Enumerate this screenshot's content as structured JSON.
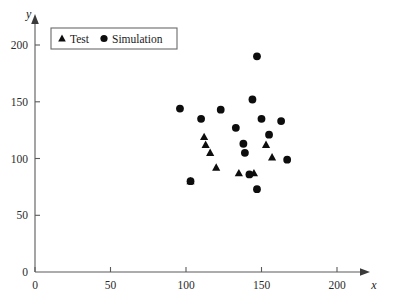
{
  "chart_data": {
    "type": "scatter",
    "title": "",
    "xlabel": "x",
    "ylabel": "y",
    "xlim": [
      0,
      215
    ],
    "ylim": [
      0,
      215
    ],
    "xticks": [
      0,
      50,
      100,
      150,
      200
    ],
    "yticks": [
      0,
      50,
      100,
      150,
      200
    ],
    "xtick_labels": [
      "0",
      "50",
      "100",
      "150",
      "200"
    ],
    "ytick_labels": [
      "0",
      "50",
      "100",
      "150",
      "200"
    ],
    "grid": false,
    "legend_position": "top-left",
    "series": [
      {
        "name": "Test",
        "marker": "triangle",
        "color": "#0d0d0d",
        "points": [
          [
            103,
            80
          ],
          [
            112,
            119
          ],
          [
            113,
            112
          ],
          [
            116,
            105
          ],
          [
            120,
            92
          ],
          [
            135,
            87
          ],
          [
            145,
            87
          ],
          [
            153,
            112
          ],
          [
            157,
            101
          ]
        ]
      },
      {
        "name": "Simulation",
        "marker": "circle",
        "color": "#0d0d0d",
        "points": [
          [
            96,
            144
          ],
          [
            103,
            80
          ],
          [
            110,
            135
          ],
          [
            123,
            143
          ],
          [
            133,
            127
          ],
          [
            138,
            113
          ],
          [
            139,
            105
          ],
          [
            142,
            86
          ],
          [
            144,
            152
          ],
          [
            147,
            190
          ],
          [
            147,
            73
          ],
          [
            150,
            135
          ],
          [
            155,
            121
          ],
          [
            163,
            133
          ],
          [
            167,
            99
          ]
        ]
      }
    ]
  },
  "legend": {
    "entries": [
      {
        "label": "Test",
        "marker": "triangle-marker-icon"
      },
      {
        "label": "Simulation",
        "marker": "circle-marker-icon"
      }
    ]
  },
  "axes": {
    "x_axis_name": "x",
    "y_axis_name": "y",
    "origin_label": "0"
  },
  "colors": {
    "marker": "#0d0d0d",
    "axis": "#5a5a5a",
    "text": "#1a1a1a",
    "background": "#ffffff"
  }
}
